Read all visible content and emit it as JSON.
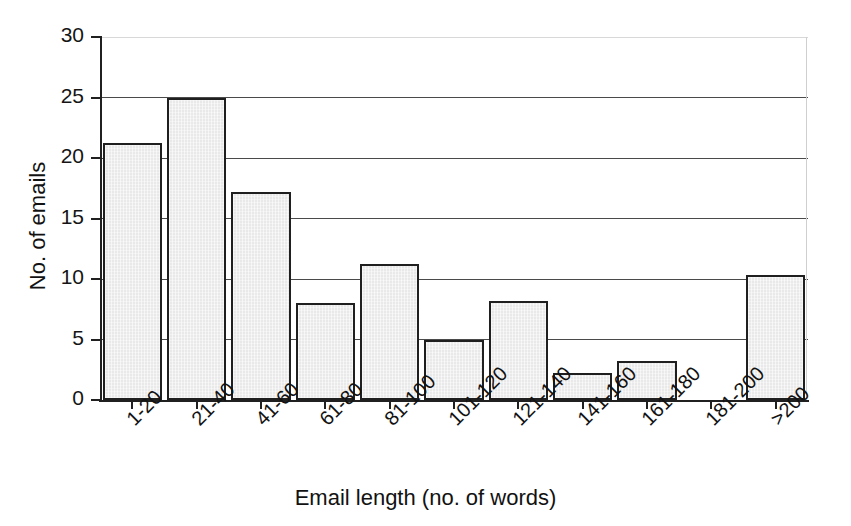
{
  "chart_data": {
    "type": "bar",
    "title": "",
    "xlabel": "Email length (no. of words)",
    "ylabel": "No. of emails",
    "categories": [
      "1-20",
      "21-40",
      "41-60",
      "61-80",
      "81-100",
      "101-120",
      "121-140",
      "141-160",
      "161-180",
      "181-200",
      ">200"
    ],
    "values": [
      21.2,
      25,
      17.2,
      8,
      11.2,
      5,
      8.2,
      2.2,
      3.2,
      0,
      10.3
    ],
    "ylim": [
      0,
      30
    ],
    "xlim_categories": 11,
    "yticks": [
      0,
      5,
      10,
      15,
      20,
      25,
      30
    ],
    "ytick_labels": [
      "0",
      "5",
      "10",
      "15",
      "20",
      "25",
      "30"
    ],
    "grid": "horizontal",
    "legend": "none",
    "series": [
      {
        "name": "No. of emails",
        "values": [
          21.2,
          25,
          17.2,
          8,
          11.2,
          5,
          8.2,
          2.2,
          3.2,
          0,
          10.3
        ]
      }
    ],
    "bar_fill_color": "#e9e9e9",
    "bar_edge_color": "#1f1f1f",
    "gridline_color": "#4a4a4a",
    "axis_color": "#202020",
    "background_color": "#ffffff",
    "xtick_label_rotation": -45
  }
}
